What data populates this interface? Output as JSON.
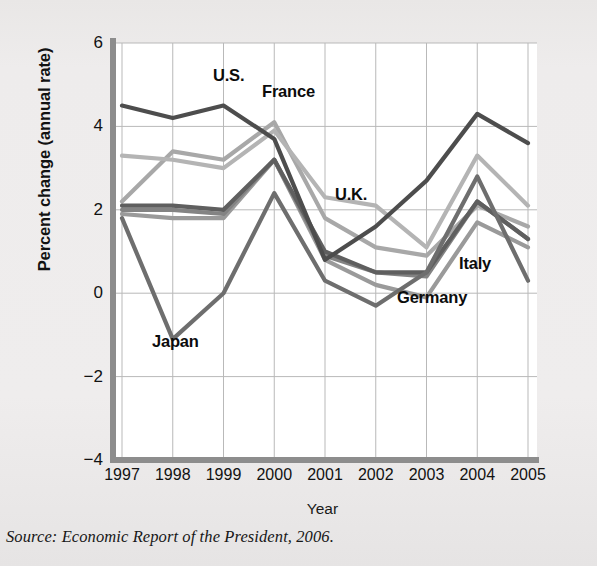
{
  "figure": {
    "source_note": "Source: Economic Report of the President, 2006.",
    "background_color": "#eceae9",
    "plot_background_color": "#ffffff"
  },
  "chart_data": {
    "type": "line",
    "title": "",
    "xlabel": "Year",
    "ylabel": "Percent change (annual rate)",
    "x": [
      1997,
      1998,
      1999,
      2000,
      2001,
      2002,
      2003,
      2004,
      2005
    ],
    "categories": [
      "1997",
      "1998",
      "1999",
      "2000",
      "2001",
      "2002",
      "2003",
      "2004",
      "2005"
    ],
    "xtick_labels": [
      "1997",
      "1998",
      "1999",
      "2000",
      "2001",
      "2002",
      "2003",
      "2004",
      "2005"
    ],
    "ytick_labels": [
      "6",
      "4",
      "2",
      "0",
      "−2",
      "−4"
    ],
    "ytick_values": [
      6,
      4,
      2,
      0,
      -2,
      -4
    ],
    "ylim": [
      -4,
      6
    ],
    "xlim": [
      1997,
      2005
    ],
    "grid": true,
    "legend": "inline-labels",
    "series": [
      {
        "name": "U.S.",
        "color": "#4d4d4d",
        "label": "U.S.",
        "values": [
          4.5,
          4.2,
          4.5,
          3.7,
          0.8,
          1.6,
          2.7,
          4.3,
          3.6
        ]
      },
      {
        "name": "France",
        "color": "#a8a8a8",
        "label": "France",
        "values": [
          2.2,
          3.4,
          3.2,
          4.1,
          1.8,
          1.1,
          0.9,
          2.1,
          1.6
        ]
      },
      {
        "name": "U.K.",
        "color": "#b4b4b4",
        "label": "U.K.",
        "values": [
          3.3,
          3.2,
          3.0,
          3.9,
          2.3,
          2.1,
          1.1,
          3.3,
          2.1
        ]
      },
      {
        "name": "Japan",
        "color": "#6e6e6e",
        "label": "Japan",
        "values": [
          1.8,
          -1.1,
          0.0,
          2.4,
          0.3,
          -0.3,
          0.5,
          2.8,
          0.3
        ]
      },
      {
        "name": "Germany",
        "color": "#9a9a9a",
        "label": "Germany",
        "values": [
          1.9,
          1.8,
          1.8,
          3.2,
          0.8,
          0.2,
          -0.1,
          1.7,
          1.1
        ]
      },
      {
        "name": "Italy",
        "color": "#838383",
        "label": "Italy",
        "values": [
          2.0,
          2.0,
          1.9,
          3.2,
          0.9,
          0.5,
          0.4,
          2.2,
          1.3
        ]
      },
      {
        "name": "Canada",
        "color": "#5f5f5f",
        "label": "",
        "values": [
          2.1,
          2.1,
          2.0,
          3.2,
          1.0,
          0.5,
          0.5,
          2.2,
          1.3
        ]
      }
    ],
    "annotations": [
      {
        "text": "U.S.",
        "x": 213,
        "y": 66
      },
      {
        "text": "France",
        "x": 262,
        "y": 82
      },
      {
        "text": "U.K.",
        "x": 335,
        "y": 185
      },
      {
        "text": "Japan",
        "x": 152,
        "y": 332
      },
      {
        "text": "Germany",
        "x": 397,
        "y": 288
      },
      {
        "text": "Italy",
        "x": 459,
        "y": 254
      }
    ]
  }
}
